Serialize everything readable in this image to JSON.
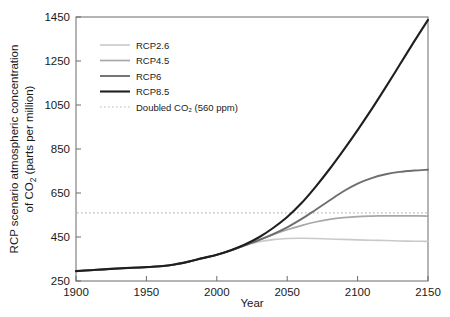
{
  "chart_data": {
    "type": "line",
    "title": "",
    "xlabel": "Year",
    "ylabel_line1": "RCP scenario atmospheric concentration",
    "ylabel_line2": "of CO2 (parts per million)",
    "ylabel_plain": "RCP scenario atmospheric concentration of CO2 (parts per million)",
    "xlim": [
      1900,
      2150
    ],
    "ylim": [
      250,
      1450
    ],
    "xticks": [
      1900,
      1950,
      2000,
      2050,
      2100,
      2150
    ],
    "yticks": [
      250,
      450,
      650,
      850,
      1050,
      1250,
      1450
    ],
    "grid": false,
    "legend_position": "upper-left-inside",
    "x": [
      1900,
      1910,
      1920,
      1930,
      1940,
      1950,
      1960,
      1970,
      1980,
      1990,
      2000,
      2010,
      2020,
      2030,
      2040,
      2050,
      2060,
      2070,
      2080,
      2090,
      2100,
      2110,
      2120,
      2130,
      2140,
      2150
    ],
    "series": [
      {
        "name": "RCP2.6",
        "color": "#c9c9c9",
        "width": 1.6,
        "dash": "none",
        "values": [
          295,
          299,
          303,
          307,
          310,
          313,
          317,
          325,
          338,
          354,
          369,
          389,
          412,
          428,
          438,
          443,
          444,
          443,
          441,
          439,
          437,
          435,
          434,
          432,
          431,
          430
        ]
      },
      {
        "name": "RCP4.5",
        "color": "#a8a8a8",
        "width": 1.7,
        "dash": "none",
        "values": [
          295,
          299,
          303,
          307,
          310,
          313,
          317,
          325,
          338,
          354,
          369,
          389,
          413,
          437,
          461,
          483,
          502,
          518,
          530,
          538,
          543,
          545,
          546,
          546,
          546,
          545
        ]
      },
      {
        "name": "RCP6",
        "color": "#6e6e6e",
        "width": 1.9,
        "dash": "none",
        "values": [
          295,
          299,
          303,
          307,
          310,
          313,
          317,
          325,
          338,
          354,
          369,
          389,
          412,
          436,
          463,
          494,
          531,
          573,
          616,
          658,
          693,
          718,
          735,
          746,
          752,
          756
        ]
      },
      {
        "name": "RCP8.5",
        "color": "#1f1f1f",
        "width": 2.1,
        "dash": "none",
        "values": [
          295,
          299,
          303,
          307,
          310,
          313,
          317,
          325,
          338,
          354,
          369,
          390,
          416,
          449,
          491,
          541,
          603,
          677,
          758,
          845,
          936,
          1031,
          1131,
          1234,
          1337,
          1437
        ]
      }
    ],
    "reference_lines": [
      {
        "name": "Doubled CO2 (560 ppm)",
        "value": 560,
        "color": "#b9b9b9",
        "width": 1.2,
        "dash": "1.6 2.4",
        "orientation": "horizontal"
      }
    ],
    "legend_entries": [
      {
        "label": "RCP2.6",
        "color": "#c9c9c9",
        "width": 1.6,
        "dash": "none"
      },
      {
        "label": "RCP4.5",
        "color": "#a8a8a8",
        "width": 1.7,
        "dash": "none"
      },
      {
        "label": "RCP6",
        "color": "#6e6e6e",
        "width": 1.9,
        "dash": "none"
      },
      {
        "label": "RCP8.5",
        "color": "#1f1f1f",
        "width": 2.1,
        "dash": "none"
      },
      {
        "label": "Doubled CO₂ (560 ppm)",
        "color": "#b9b9b9",
        "width": 1.2,
        "dash": "1.6 2.4"
      }
    ]
  },
  "axis": {
    "x_title": "Year",
    "y_title_line1": "RCP scenario atmospheric concentration",
    "y_title_line2_pre": "of CO",
    "y_title_line2_sub": "2",
    "y_title_line2_post": " (parts per million)"
  },
  "colors": {
    "frame": "#6b6b6b",
    "text": "#1a1a1a",
    "background": "#ffffff"
  }
}
